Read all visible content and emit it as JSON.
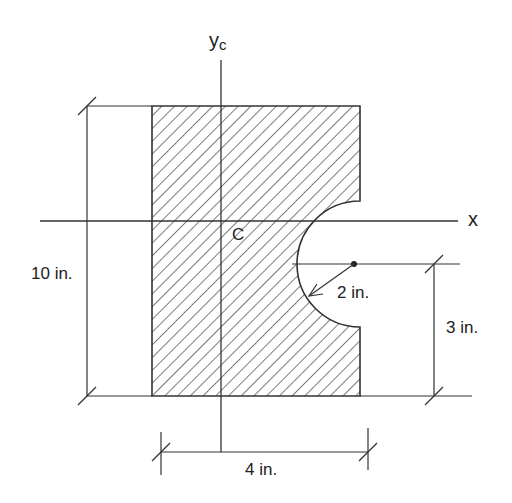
{
  "diagram": {
    "axes": {
      "vertical_label": "y",
      "vertical_subscript": "c",
      "horizontal_label": "x",
      "centroid_label": "C"
    },
    "dimensions": {
      "height": "10 in.",
      "width": "4 in.",
      "radius": "2 in.",
      "notch_offset": "3 in."
    },
    "colors": {
      "line": "#333333",
      "hatch": "#444444",
      "background": "#ffffff"
    }
  }
}
